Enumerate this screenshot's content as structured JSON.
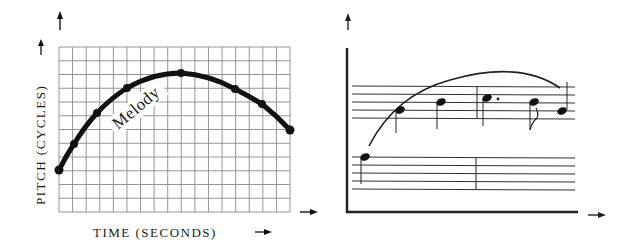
{
  "left_diagram": {
    "curve_label": "Melody",
    "y_axis_label": "PITCH (CYCLES)",
    "x_axis_label": "TIME (SECONDS)",
    "grid": {
      "columns": 17,
      "rows": 12,
      "color": "#8a8a8a"
    },
    "curve_color": "#111111"
  },
  "right_diagram": {
    "staves": 2,
    "notes": [
      {
        "label": "note-1",
        "staff": "lower",
        "stem": "down"
      },
      {
        "label": "note-2",
        "staff": "upper",
        "stem": "down"
      },
      {
        "label": "note-3",
        "staff": "upper",
        "stem": "down"
      },
      {
        "label": "note-4",
        "staff": "upper",
        "stem": "down",
        "dotted": true
      },
      {
        "label": "note-5",
        "staff": "upper",
        "stem": "down",
        "flag": true
      },
      {
        "label": "note-6",
        "staff": "upper",
        "stem": "up"
      }
    ],
    "line_color": "#222222"
  },
  "chart_data": {
    "type": "line",
    "title": "",
    "xlabel": "TIME (SECONDS)",
    "ylabel": "PITCH (CYCLES)",
    "series": [
      {
        "name": "Melody",
        "x": [
          0,
          1.1,
          2.8,
          5,
          9,
          13,
          15,
          17
        ],
        "values": [
          3,
          4.9,
          7.2,
          9,
          10.1,
          8.9,
          7.8,
          6
        ]
      }
    ],
    "xlim": [
      0,
      17
    ],
    "ylim": [
      0,
      12
    ],
    "grid": true
  }
}
